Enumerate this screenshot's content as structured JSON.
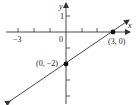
{
  "diagram": {
    "type": "coordinate-plane-line",
    "axes": {
      "x_label": "x",
      "y_label": "y",
      "x_tick_labels": [
        {
          "value": -3,
          "text": "−3"
        },
        {
          "value": 0,
          "text": "0"
        }
      ],
      "y_tick_labels": [
        {
          "value": 1,
          "text": "1"
        }
      ],
      "x_range": [
        -3,
        3
      ],
      "y_range": [
        -4,
        1
      ]
    },
    "line": {
      "passes_through": [
        [
          0,
          -2
        ],
        [
          3,
          0
        ]
      ],
      "arrows": "both-ends"
    },
    "points": [
      {
        "x": 3,
        "y": 0,
        "label": "(3, 0)"
      },
      {
        "x": 0,
        "y": -2,
        "label": "(0, −2)"
      }
    ],
    "colors": {
      "stroke": "#333333",
      "background": "#ffffff"
    }
  }
}
